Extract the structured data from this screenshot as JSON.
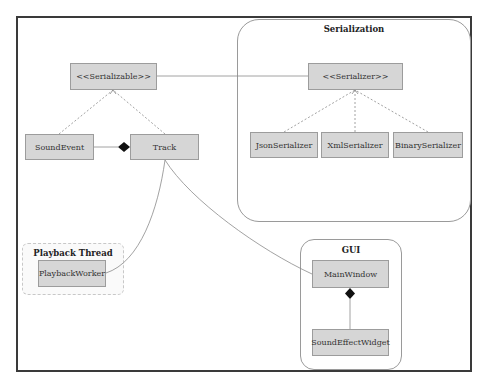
{
  "diagram": {
    "groups": {
      "serialization": {
        "title": "Serialization"
      },
      "gui": {
        "title": "GUI"
      },
      "playback_thread": {
        "title": "Playback Thread"
      }
    },
    "nodes": {
      "serializable": "<<Serializable>>",
      "sound_event": "SoundEvent",
      "track": "Track",
      "serializer": "<<Serializer>>",
      "json_serializer": "JsonSerializer",
      "xml_serializer": "XmlSerializer",
      "binary_serializer": "BinarySerializer",
      "playback_worker": "PlaybackWorker",
      "main_window": "MainWindow",
      "sound_effect_widget": "SoundEffectWidget"
    },
    "edges": [
      {
        "from": "sound_event",
        "to": "serializable",
        "style": "dashed",
        "type": "realization"
      },
      {
        "from": "track",
        "to": "serializable",
        "style": "dashed",
        "type": "realization"
      },
      {
        "from": "serializable",
        "to": "serializer",
        "style": "solid",
        "type": "association"
      },
      {
        "from": "json_serializer",
        "to": "serializer",
        "style": "dashed",
        "type": "realization"
      },
      {
        "from": "xml_serializer",
        "to": "serializer",
        "style": "dashed",
        "type": "realization"
      },
      {
        "from": "binary_serializer",
        "to": "serializer",
        "style": "dashed",
        "type": "realization"
      },
      {
        "from": "sound_event",
        "to": "track",
        "style": "solid",
        "type": "composition"
      },
      {
        "from": "track",
        "to": "playback_worker",
        "style": "solid",
        "type": "association"
      },
      {
        "from": "track",
        "to": "main_window",
        "style": "solid",
        "type": "association"
      },
      {
        "from": "sound_effect_widget",
        "to": "main_window",
        "style": "solid",
        "type": "composition"
      }
    ],
    "colors": {
      "node_fill": "#d6d6d6",
      "node_border": "#9c9c9c",
      "frame_border": "#3a3a3a",
      "edge": "#8a8a8a"
    }
  }
}
